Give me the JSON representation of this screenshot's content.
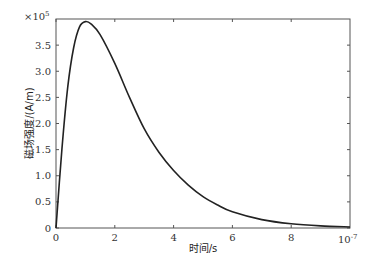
{
  "chart_data": {
    "type": "line",
    "title": "",
    "xlabel": "时间/s",
    "ylabel": "磁场强度/(A/m)",
    "x_multiplier": "10",
    "x_multiplier_exp": "-7",
    "y_multiplier": "×10",
    "y_multiplier_exp": "5",
    "xlim": [
      0,
      10
    ],
    "ylim": [
      0,
      4.0
    ],
    "xticks": [
      0,
      2,
      4,
      6,
      8
    ],
    "xtick_labels": [
      "0",
      "2",
      "4",
      "6",
      "8"
    ],
    "yticks": [
      0,
      0.5,
      1.0,
      1.5,
      2.0,
      2.5,
      3.0,
      3.5
    ],
    "ytick_labels": [
      "0",
      "0.5",
      "1.0",
      "1.5",
      "2.0",
      "2.5",
      "3.0",
      "3.5"
    ],
    "grid": false,
    "legend": null,
    "series": [
      {
        "name": "磁场强度",
        "color": "#222222",
        "x": [
          0,
          0.2,
          0.4,
          0.6,
          0.8,
          1.0,
          1.2,
          1.5,
          2.0,
          2.5,
          3.0,
          3.5,
          4.0,
          4.5,
          5.0,
          5.5,
          6.0,
          7.0,
          8.0,
          9.0,
          10.0
        ],
        "y": [
          0,
          1.5,
          2.7,
          3.45,
          3.85,
          3.95,
          3.9,
          3.7,
          3.15,
          2.5,
          1.9,
          1.45,
          1.1,
          0.82,
          0.6,
          0.44,
          0.31,
          0.16,
          0.08,
          0.04,
          0.02
        ]
      }
    ]
  }
}
